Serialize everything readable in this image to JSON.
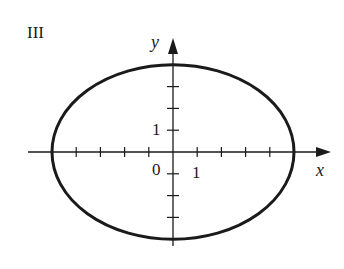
{
  "panel_label": "III",
  "axes": {
    "x_label": "x",
    "y_label": "y",
    "origin_label": "0",
    "x_unit_label": "1",
    "y_unit_label": "1",
    "x_ticks": [
      -4,
      -3,
      -2,
      -1,
      1,
      2,
      3,
      4
    ],
    "y_ticks": [
      -3,
      -2,
      -1,
      1,
      2,
      3
    ]
  },
  "curve": {
    "type": "ellipse",
    "center": [
      0,
      0
    ],
    "semi_axis_x": 5,
    "semi_axis_y": 4,
    "color": "#1a1a1a"
  }
}
